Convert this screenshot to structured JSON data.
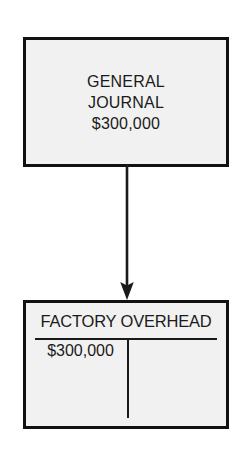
{
  "diagram": {
    "colors": {
      "background": "#ffffff",
      "box_fill": "#f1f1f1",
      "box_border": "#111111",
      "text": "#1a1a1a",
      "arrow": "#1a1a1a"
    },
    "source_document": {
      "name": "general-journal",
      "lines": [
        "GENERAL",
        "JOURNAL",
        "$300,000"
      ],
      "line1": "GENERAL",
      "line2": "JOURNAL",
      "amount": "$300,000"
    },
    "connector": {
      "name": "posting-arrow",
      "direction": "down",
      "from": "general-journal",
      "to": "factory-overhead"
    },
    "t_account": {
      "name": "factory-overhead",
      "title": "FACTORY OVERHEAD",
      "debit_amount": "$300,000",
      "credit_amount": ""
    }
  }
}
